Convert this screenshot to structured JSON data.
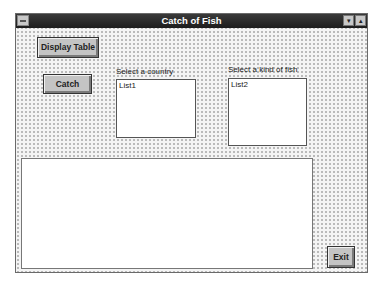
{
  "window": {
    "title": "Catch of Fish",
    "controls": {
      "system_menu_icon": "system-menu-icon",
      "minimize_icon": "▾",
      "maximize_icon": "▴"
    }
  },
  "buttons": {
    "display_table": "Display Table",
    "catch": "Catch",
    "exit": "Exit"
  },
  "country_list": {
    "label": "Select a country",
    "items": [
      "List1"
    ]
  },
  "fish_list": {
    "label": "Select a kind of fish",
    "items": [
      "List2"
    ]
  },
  "output_box": {
    "value": ""
  }
}
